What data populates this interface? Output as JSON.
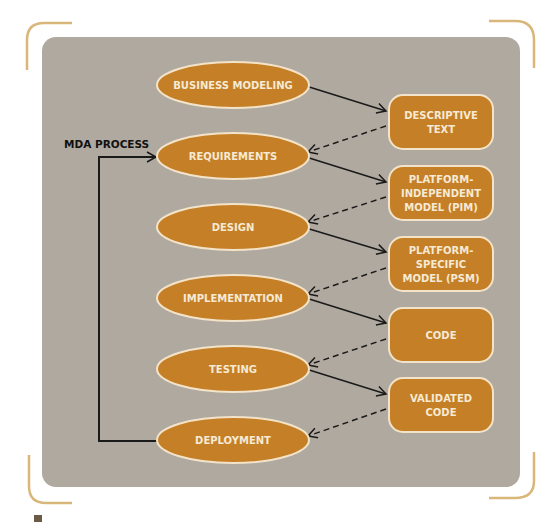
{
  "diagram": {
    "side_label": "MDA PROCESS",
    "colors": {
      "background": "#ffffff",
      "panel": "#b0a99f",
      "node_fill": "#c47f27",
      "node_stroke": "#f3e3c8",
      "node_text": "#f6ead4",
      "arrow": "#1a1a1a",
      "bracket": "#d9b77a"
    },
    "phases": [
      {
        "id": "business-modeling",
        "label": "BUSINESS MODELING"
      },
      {
        "id": "requirements",
        "label": "REQUIREMENTS"
      },
      {
        "id": "design",
        "label": "DESIGN"
      },
      {
        "id": "implementation",
        "label": "IMPLEMENTATION"
      },
      {
        "id": "testing",
        "label": "TESTING"
      },
      {
        "id": "deployment",
        "label": "DEPLOYMENT"
      }
    ],
    "artifacts": [
      {
        "id": "descriptive-text",
        "lines": [
          "DESCRIPTIVE",
          "TEXT"
        ]
      },
      {
        "id": "pim",
        "lines": [
          "PLATFORM-",
          "INDEPENDENT",
          "MODEL (PIM)"
        ]
      },
      {
        "id": "psm",
        "lines": [
          "PLATFORM-",
          "SPECIFIC",
          "MODEL (PSM)"
        ]
      },
      {
        "id": "code",
        "lines": [
          "CODE"
        ]
      },
      {
        "id": "validated-code",
        "lines": [
          "VALIDATED",
          "CODE"
        ]
      }
    ],
    "edges": [
      {
        "from": "business-modeling",
        "to": "descriptive-text",
        "style": "solid"
      },
      {
        "from": "descriptive-text",
        "to": "requirements",
        "style": "dashed"
      },
      {
        "from": "requirements",
        "to": "pim",
        "style": "solid"
      },
      {
        "from": "pim",
        "to": "design",
        "style": "dashed"
      },
      {
        "from": "design",
        "to": "psm",
        "style": "solid"
      },
      {
        "from": "psm",
        "to": "implementation",
        "style": "dashed"
      },
      {
        "from": "implementation",
        "to": "code",
        "style": "solid"
      },
      {
        "from": "code",
        "to": "testing",
        "style": "dashed"
      },
      {
        "from": "testing",
        "to": "validated-code",
        "style": "solid"
      },
      {
        "from": "validated-code",
        "to": "deployment",
        "style": "dashed"
      },
      {
        "from": "deployment",
        "to": "requirements",
        "style": "loop"
      }
    ]
  }
}
